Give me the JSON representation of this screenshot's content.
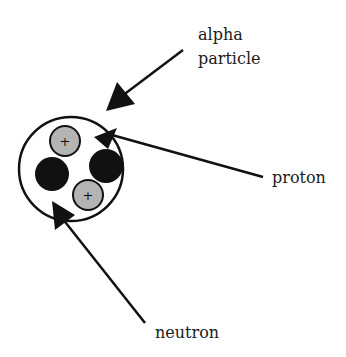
{
  "diagram": {
    "labels": {
      "alpha_line1": "alpha",
      "alpha_line2": "particle",
      "proton": "proton",
      "neutron": "neutron"
    },
    "particles": [
      {
        "type": "proton",
        "symbol": "+",
        "cx": 65,
        "cy": 141,
        "r": 15
      },
      {
        "type": "neutron",
        "cx": 52,
        "cy": 174,
        "r": 17
      },
      {
        "type": "neutron",
        "cx": 106,
        "cy": 166,
        "r": 17
      },
      {
        "type": "proton",
        "symbol": "+",
        "cx": 88,
        "cy": 195,
        "r": 15
      }
    ],
    "colors": {
      "proton_fill": "#b4b4b4",
      "neutron_fill": "#111111",
      "stroke": "#111111",
      "background": "#ffffff"
    }
  }
}
